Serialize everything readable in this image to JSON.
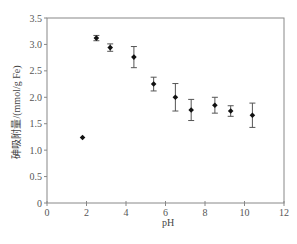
{
  "chart_data": {
    "type": "scatter",
    "title": "",
    "xlabel": "pH",
    "ylabel": "砷吸附量/(mmol/g Fe)",
    "xlim": [
      0,
      12
    ],
    "ylim": [
      0,
      3.5
    ],
    "xticks": [
      0,
      2,
      4,
      6,
      8,
      10,
      12
    ],
    "xtick_labels": [
      "0",
      "2",
      "4",
      "6",
      "8",
      "10",
      "12"
    ],
    "yticks": [
      0,
      0.5,
      1.0,
      1.5,
      2.0,
      2.5,
      3.0,
      3.5
    ],
    "ytick_labels": [
      "0",
      "0.5",
      "1.0",
      "1.5",
      "2.0",
      "2.5",
      "3.0",
      "3.5"
    ],
    "grid": false,
    "legend": null,
    "series": [
      {
        "name": "arsenic adsorption",
        "marker": "diamond",
        "color": "#111111",
        "x": [
          1.8,
          2.5,
          3.2,
          4.4,
          5.4,
          6.5,
          7.3,
          8.5,
          9.3,
          10.4
        ],
        "y": [
          1.24,
          3.12,
          2.94,
          2.76,
          2.25,
          2.0,
          1.76,
          1.85,
          1.74,
          1.66
        ],
        "error": [
          0.0,
          0.05,
          0.07,
          0.2,
          0.13,
          0.26,
          0.2,
          0.15,
          0.1,
          0.23
        ]
      }
    ]
  },
  "colors": {
    "axis": "#888888",
    "marker": "#111111",
    "errorbar": "#555555",
    "text": "#555555"
  }
}
